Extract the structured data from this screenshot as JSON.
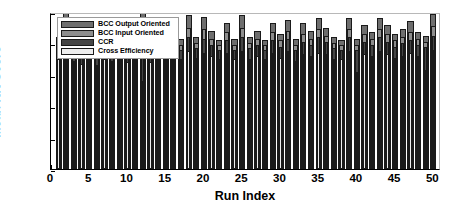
{
  "chart_data": {
    "type": "bar",
    "title": "",
    "subtitle": "",
    "xlabel": "Run Index",
    "ylabel": "Mean NN Score",
    "xlim": [
      0,
      51
    ],
    "ylim": [
      0,
      1
    ],
    "xticks": [
      0,
      5,
      10,
      15,
      20,
      25,
      30,
      35,
      40,
      45,
      50
    ],
    "xticklabels": [
      "0",
      "5",
      "10",
      "15",
      "20",
      "25",
      "30",
      "35",
      "40",
      "45",
      "50"
    ],
    "yticks": [
      0,
      0.2,
      0.4,
      0.6,
      0.8,
      1
    ],
    "yticklabels": [
      "0",
      "0.2",
      "0.4",
      "0.6",
      "0.8",
      "1"
    ],
    "grid": false,
    "legend_position": "top-left",
    "bar_style": "overlaid",
    "categories": [
      1,
      2,
      3,
      4,
      5,
      6,
      7,
      8,
      9,
      10,
      11,
      12,
      13,
      14,
      15,
      16,
      17,
      18,
      19,
      20,
      21,
      22,
      23,
      24,
      25,
      26,
      27,
      28,
      29,
      30,
      31,
      32,
      33,
      34,
      35,
      36,
      37,
      38,
      39,
      40,
      41,
      42,
      43,
      44,
      45,
      46,
      47,
      48,
      49,
      50
    ],
    "series": [
      {
        "name": "BCC Output Oriented",
        "color": "#6e6e6e",
        "values": [
          0.84,
          1.0,
          0.8,
          0.79,
          0.81,
          0.79,
          0.81,
          0.8,
          0.81,
          0.8,
          0.82,
          1.0,
          0.81,
          0.8,
          0.93,
          0.88,
          0.83,
          0.98,
          0.84,
          0.97,
          0.88,
          0.82,
          0.93,
          0.83,
          0.98,
          0.84,
          0.88,
          0.82,
          0.93,
          0.86,
          0.95,
          0.83,
          0.93,
          0.88,
          0.96,
          0.9,
          0.84,
          0.82,
          0.96,
          0.83,
          0.92,
          0.87,
          0.96,
          0.92,
          0.86,
          0.89,
          0.94,
          0.87,
          0.85,
          0.99
        ]
      },
      {
        "name": "BCC Input Oriented",
        "color": "#8d8d8d",
        "values": [
          0.79,
          0.79,
          0.76,
          0.76,
          0.77,
          0.75,
          0.77,
          0.76,
          0.78,
          0.77,
          0.78,
          0.78,
          0.77,
          0.77,
          0.86,
          0.83,
          0.79,
          0.9,
          0.8,
          0.89,
          0.83,
          0.79,
          0.87,
          0.79,
          0.9,
          0.8,
          0.83,
          0.79,
          0.87,
          0.82,
          0.88,
          0.79,
          0.86,
          0.83,
          0.89,
          0.85,
          0.8,
          0.79,
          0.89,
          0.79,
          0.86,
          0.83,
          0.89,
          0.86,
          0.82,
          0.84,
          0.87,
          0.83,
          0.81,
          0.91
        ]
      },
      {
        "name": "CCR",
        "color": "#454545",
        "values": [
          0.76,
          0.75,
          0.73,
          0.72,
          0.74,
          0.71,
          0.74,
          0.73,
          0.75,
          0.73,
          0.74,
          0.74,
          0.73,
          0.74,
          0.8,
          0.78,
          0.76,
          0.84,
          0.77,
          0.83,
          0.79,
          0.76,
          0.82,
          0.76,
          0.84,
          0.77,
          0.79,
          0.76,
          0.82,
          0.78,
          0.83,
          0.76,
          0.81,
          0.79,
          0.84,
          0.81,
          0.77,
          0.76,
          0.84,
          0.76,
          0.81,
          0.79,
          0.84,
          0.81,
          0.78,
          0.8,
          0.82,
          0.79,
          0.78,
          0.85
        ]
      },
      {
        "name": "Cross Efficiency",
        "color": "#ededed",
        "values": [
          0.7,
          0.72,
          0.69,
          0.67,
          0.7,
          0.66,
          0.7,
          0.69,
          0.71,
          0.68,
          0.71,
          0.56,
          0.68,
          0.7,
          0.72,
          0.71,
          0.7,
          0.75,
          0.71,
          0.74,
          0.72,
          0.7,
          0.74,
          0.7,
          0.75,
          0.7,
          0.72,
          0.7,
          0.74,
          0.71,
          0.75,
          0.69,
          0.73,
          0.72,
          0.74,
          0.73,
          0.7,
          0.7,
          0.75,
          0.62,
          0.73,
          0.72,
          0.75,
          0.73,
          0.71,
          0.72,
          0.74,
          0.72,
          0.63,
          0.76
        ]
      }
    ]
  },
  "legend": {
    "items": [
      {
        "label": "BCC Output Oriented",
        "color": "#6e6e6e"
      },
      {
        "label": "BCC Input Oriented",
        "color": "#8d8d8d"
      },
      {
        "label": "CCR",
        "color": "#454545"
      },
      {
        "label": "Cross Efficiency",
        "color": "#ededed"
      }
    ]
  }
}
